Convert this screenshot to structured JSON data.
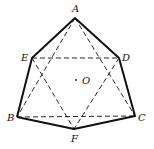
{
  "diagram": {
    "type": "geometric-polyhedron",
    "colors": {
      "stroke": "#111111",
      "background": "#ffffff"
    },
    "points": {
      "A": {
        "x": 75,
        "y": 18,
        "label": "A"
      },
      "E": {
        "x": 32,
        "y": 58,
        "label": "E"
      },
      "D": {
        "x": 119,
        "y": 58,
        "label": "D"
      },
      "B": {
        "x": 17,
        "y": 117,
        "label": "B"
      },
      "C": {
        "x": 135,
        "y": 116,
        "label": "C"
      },
      "F": {
        "x": 74,
        "y": 129,
        "label": "F"
      },
      "O": {
        "x": 76,
        "y": 80,
        "label": "O"
      }
    },
    "solid_edges": [
      [
        "A",
        "E"
      ],
      [
        "A",
        "D"
      ],
      [
        "E",
        "B"
      ],
      [
        "D",
        "C"
      ],
      [
        "B",
        "F"
      ],
      [
        "F",
        "C"
      ]
    ],
    "dashed_edges": [
      [
        "E",
        "D"
      ],
      [
        "B",
        "C"
      ],
      [
        "A",
        "B"
      ],
      [
        "A",
        "C"
      ],
      [
        "E",
        "F"
      ],
      [
        "D",
        "F"
      ]
    ],
    "labels": {
      "A": "A",
      "B": "B",
      "C": "C",
      "D": "D",
      "E": "E",
      "F": "F",
      "O": "O"
    }
  }
}
